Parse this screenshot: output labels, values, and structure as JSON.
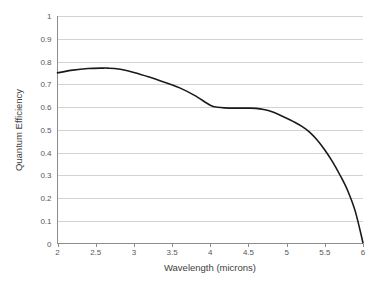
{
  "chart_data": {
    "type": "line",
    "title": "",
    "subtitle": "",
    "xlabel": "Wavelength (microns)",
    "ylabel": "Quantum Efficiency",
    "xlim": [
      2,
      6
    ],
    "ylim": [
      0,
      1
    ],
    "grid": "horizontal",
    "legend": "none",
    "line_color": "#1a1a1a",
    "gridline_color": "#d3d3d3",
    "axis_color": "#8c8c8c",
    "background_color": "#ffffff",
    "x_ticks": [
      "2",
      "2.5",
      "3",
      "3.5",
      "4",
      "4.5",
      "5",
      "5.5",
      "6"
    ],
    "x_tick_values": [
      2,
      2.5,
      3,
      3.5,
      4,
      4.5,
      5,
      5.5,
      6
    ],
    "y_ticks": [
      "0",
      "0.1",
      "0.2",
      "0.3",
      "0.4",
      "0.5",
      "0.6",
      "0.7",
      "0.8",
      "0.9",
      "1"
    ],
    "y_tick_values": [
      0,
      0.1,
      0.2,
      0.3,
      0.4,
      0.5,
      0.6,
      0.7,
      0.8,
      0.9,
      1
    ],
    "series": [
      {
        "name": "Quantum Efficiency",
        "x": [
          2.0,
          2.2,
          2.4,
          2.6,
          2.65,
          2.8,
          3.0,
          3.2,
          3.4,
          3.6,
          3.8,
          4.0,
          4.1,
          4.2,
          4.3,
          4.4,
          4.5,
          4.6,
          4.7,
          4.8,
          5.0,
          5.1,
          5.2,
          5.3,
          5.4,
          5.5,
          5.6,
          5.7,
          5.8,
          5.9,
          6.0
        ],
        "values": [
          0.75,
          0.762,
          0.769,
          0.771,
          0.771,
          0.767,
          0.752,
          0.732,
          0.709,
          0.684,
          0.65,
          0.608,
          0.599,
          0.596,
          0.595,
          0.595,
          0.595,
          0.594,
          0.589,
          0.58,
          0.551,
          0.534,
          0.515,
          0.49,
          0.455,
          0.411,
          0.36,
          0.3,
          0.232,
          0.14,
          0.003
        ]
      }
    ]
  },
  "axes": {
    "y_axis_title": "Quantum Efficiency",
    "x_axis_title": "Wavelength (microns)"
  }
}
